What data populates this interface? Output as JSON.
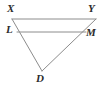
{
  "figure": {
    "background_color": "#ffffff",
    "stroke_color": "#8c8c8c",
    "label_color": "#2b2b2b",
    "stroke_width": 1,
    "labels": {
      "X": "X",
      "Y": "Y",
      "L": "L",
      "M": "M",
      "D": "D"
    },
    "points": {
      "X": {
        "x": 12,
        "y": 19
      },
      "Y": {
        "x": 96,
        "y": 19
      },
      "L": {
        "x": 17,
        "y": 32
      },
      "M": {
        "x": 86,
        "y": 32
      },
      "D": {
        "x": 42,
        "y": 71
      }
    },
    "segments": [
      {
        "name": "XY",
        "from": "X",
        "to": "Y"
      },
      {
        "name": "LM",
        "from": "L",
        "to": "M"
      },
      {
        "name": "XD",
        "from": "X",
        "to": "D"
      },
      {
        "name": "YD",
        "from": "Y",
        "to": "D"
      }
    ]
  }
}
